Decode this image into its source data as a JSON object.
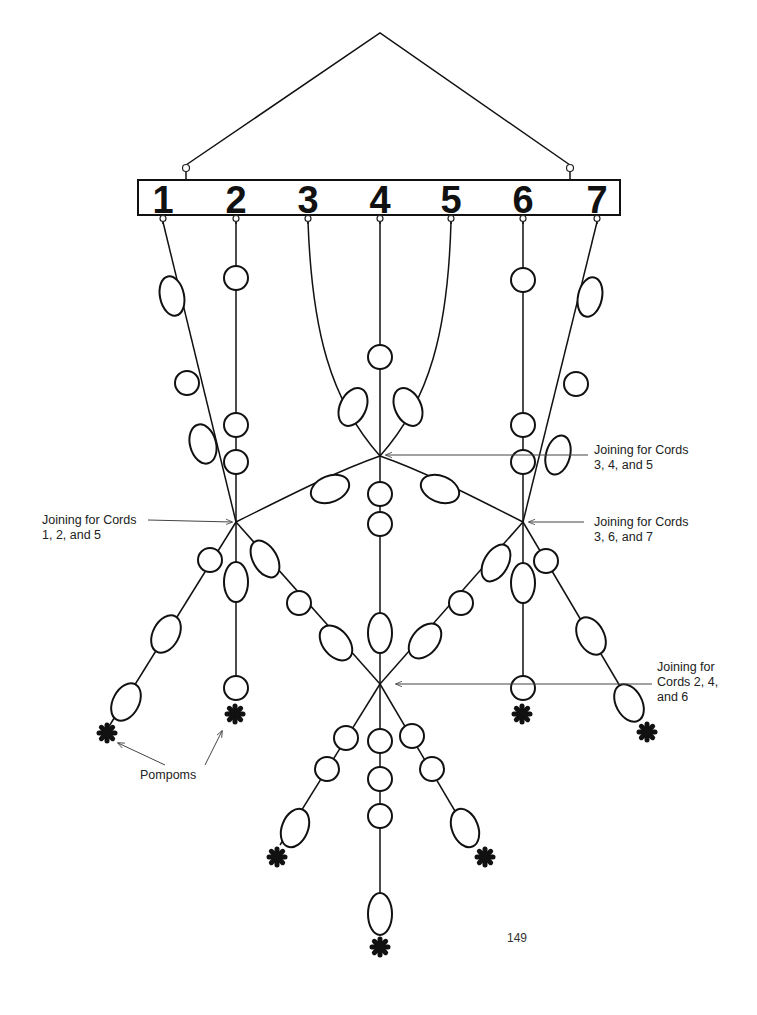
{
  "page": {
    "page_number": "149",
    "background": "#ffffff",
    "ink": "#111111"
  },
  "hanger": {
    "apex": [
      380,
      33
    ],
    "left_ring": [
      186,
      168
    ],
    "right_ring": [
      570,
      168
    ]
  },
  "bar": {
    "x": 138,
    "y": 180,
    "width": 482,
    "height": 35,
    "cord_numbers": [
      {
        "label": "1",
        "x": 163
      },
      {
        "label": "2",
        "x": 236
      },
      {
        "label": "3",
        "x": 308
      },
      {
        "label": "4",
        "x": 380
      },
      {
        "label": "5",
        "x": 451
      },
      {
        "label": "6",
        "x": 523
      },
      {
        "label": "7",
        "x": 597
      }
    ]
  },
  "joinings": [
    {
      "id": "J1",
      "cords": "1, 2, and 5",
      "x": 236,
      "y": 522
    },
    {
      "id": "J2",
      "cords": "3, 4, and 5",
      "x": 380,
      "y": 456
    },
    {
      "id": "J3",
      "cords": "3, 6, and 7",
      "x": 523,
      "y": 522
    },
    {
      "id": "J4",
      "cords": "2, 4, and 6",
      "x": 380,
      "y": 684
    }
  ],
  "callouts": [
    {
      "lines": [
        "Joining for Cords",
        "1, 2, and 5"
      ],
      "text_x": 42,
      "text_y": 524,
      "line_from": [
        148,
        520
      ],
      "arrow_to": [
        232,
        522
      ]
    },
    {
      "lines": [
        "Joining for Cords",
        "3, 4, and 5"
      ],
      "text_x": 594,
      "text_y": 454,
      "line_from": [
        588,
        455
      ],
      "arrow_to": [
        386,
        455
      ]
    },
    {
      "lines": [
        "Joining for Cords",
        "3, 6, and 7"
      ],
      "text_x": 594,
      "text_y": 526,
      "line_from": [
        584,
        522
      ],
      "arrow_to": [
        529,
        522
      ]
    },
    {
      "lines": [
        "Joining for",
        "Cords 2, 4,",
        "and 6"
      ],
      "text_x": 657,
      "text_y": 671,
      "line_from": [
        652,
        684
      ],
      "arrow_to": [
        396,
        684
      ]
    },
    {
      "lines": [
        "Pompoms"
      ],
      "text_x": 140,
      "text_y": 779,
      "line_from": [
        165,
        765
      ],
      "arrow_to": [
        118,
        743
      ],
      "line_from2": [
        205,
        765
      ],
      "arrow_to2": [
        222,
        731
      ]
    }
  ],
  "cords": [
    {
      "name": "cord-1",
      "path": "M163,222 L236,522"
    },
    {
      "name": "cord-2",
      "path": "M236,222 L236,522"
    },
    {
      "name": "cord-3",
      "path": "M308,222 C312,330 330,400 380,456"
    },
    {
      "name": "cord-4",
      "path": "M380,222 L380,684"
    },
    {
      "name": "cord-5",
      "path": "M451,222 C448,330 430,400 380,456"
    },
    {
      "name": "cord-6",
      "path": "M523,222 L523,522"
    },
    {
      "name": "cord-7",
      "path": "M597,222 L523,522"
    },
    {
      "name": "j2-to-j1",
      "path": "M380,456 C340,470 300,490 236,522"
    },
    {
      "name": "j2-to-j3",
      "path": "M380,456 C420,470 460,490 523,522"
    },
    {
      "name": "j1-down-left",
      "path": "M236,522 L108,728"
    },
    {
      "name": "j1-down-center",
      "path": "M236,522 L236,690"
    },
    {
      "name": "j1-to-j4",
      "path": "M236,522 L380,684"
    },
    {
      "name": "j3-to-j4",
      "path": "M523,522 L380,684"
    },
    {
      "name": "j3-down-center",
      "path": "M523,522 L523,690"
    },
    {
      "name": "j3-down-right",
      "path": "M523,522 L640,720"
    },
    {
      "name": "j4-down-left",
      "path": "M380,684 L280,845"
    },
    {
      "name": "j4-down-center",
      "path": "M380,684 L380,935"
    },
    {
      "name": "j4-down-right",
      "path": "M380,684 L475,845"
    }
  ],
  "beads": [
    {
      "cx": 172,
      "cy": 296,
      "rx": 12,
      "ry": 20,
      "rot": -12
    },
    {
      "cx": 187,
      "cy": 383,
      "rx": 12,
      "ry": 12,
      "rot": 0
    },
    {
      "cx": 203,
      "cy": 444,
      "rx": 13,
      "ry": 20,
      "rot": -15
    },
    {
      "cx": 236,
      "cy": 278,
      "rx": 12,
      "ry": 12,
      "rot": 0
    },
    {
      "cx": 236,
      "cy": 425,
      "rx": 12,
      "ry": 12,
      "rot": 0
    },
    {
      "cx": 236,
      "cy": 462,
      "rx": 12,
      "ry": 12,
      "rot": 0
    },
    {
      "cx": 353,
      "cy": 407,
      "rx": 13,
      "ry": 20,
      "rot": 25
    },
    {
      "cx": 408,
      "cy": 407,
      "rx": 13,
      "ry": 20,
      "rot": -25
    },
    {
      "cx": 380,
      "cy": 357,
      "rx": 12,
      "ry": 12,
      "rot": 0
    },
    {
      "cx": 380,
      "cy": 494,
      "rx": 12,
      "ry": 12,
      "rot": 0
    },
    {
      "cx": 380,
      "cy": 524,
      "rx": 12,
      "ry": 12,
      "rot": 0
    },
    {
      "cx": 330,
      "cy": 489,
      "rx": 20,
      "ry": 13,
      "rot": -22
    },
    {
      "cx": 440,
      "cy": 489,
      "rx": 20,
      "ry": 13,
      "rot": 22
    },
    {
      "cx": 523,
      "cy": 280,
      "rx": 12,
      "ry": 12,
      "rot": 0
    },
    {
      "cx": 523,
      "cy": 425,
      "rx": 12,
      "ry": 12,
      "rot": 0
    },
    {
      "cx": 523,
      "cy": 462,
      "rx": 12,
      "ry": 12,
      "rot": 0
    },
    {
      "cx": 590,
      "cy": 297,
      "rx": 12,
      "ry": 20,
      "rot": 12
    },
    {
      "cx": 576,
      "cy": 384,
      "rx": 12,
      "ry": 12,
      "rot": 0
    },
    {
      "cx": 558,
      "cy": 455,
      "rx": 12,
      "ry": 20,
      "rot": 15
    },
    {
      "cx": 210,
      "cy": 560,
      "rx": 12,
      "ry": 12,
      "rot": 0
    },
    {
      "cx": 166,
      "cy": 634,
      "rx": 13,
      "ry": 20,
      "rot": 28
    },
    {
      "cx": 126,
      "cy": 702,
      "rx": 13,
      "ry": 20,
      "rot": 28
    },
    {
      "cx": 236,
      "cy": 582,
      "rx": 12,
      "ry": 20,
      "rot": 0
    },
    {
      "cx": 236,
      "cy": 688,
      "rx": 12,
      "ry": 12,
      "rot": 0
    },
    {
      "cx": 265,
      "cy": 559,
      "rx": 12,
      "ry": 20,
      "rot": -30
    },
    {
      "cx": 299,
      "cy": 603,
      "rx": 12,
      "ry": 12,
      "rot": 0
    },
    {
      "cx": 336,
      "cy": 643,
      "rx": 13,
      "ry": 20,
      "rot": -40
    },
    {
      "cx": 380,
      "cy": 633,
      "rx": 12,
      "ry": 20,
      "rot": 0
    },
    {
      "cx": 425,
      "cy": 641,
      "rx": 13,
      "ry": 20,
      "rot": 40
    },
    {
      "cx": 461,
      "cy": 603,
      "rx": 12,
      "ry": 12,
      "rot": 0
    },
    {
      "cx": 496,
      "cy": 563,
      "rx": 12,
      "ry": 20,
      "rot": 30
    },
    {
      "cx": 523,
      "cy": 583,
      "rx": 12,
      "ry": 20,
      "rot": 0
    },
    {
      "cx": 523,
      "cy": 688,
      "rx": 12,
      "ry": 12,
      "rot": 0
    },
    {
      "cx": 546,
      "cy": 561,
      "rx": 12,
      "ry": 12,
      "rot": 0
    },
    {
      "cx": 591,
      "cy": 636,
      "rx": 13,
      "ry": 20,
      "rot": -28
    },
    {
      "cx": 629,
      "cy": 703,
      "rx": 13,
      "ry": 20,
      "rot": -28
    },
    {
      "cx": 346,
      "cy": 738,
      "rx": 12,
      "ry": 12,
      "rot": 0
    },
    {
      "cx": 327,
      "cy": 769,
      "rx": 12,
      "ry": 12,
      "rot": 0
    },
    {
      "cx": 295,
      "cy": 828,
      "rx": 13,
      "ry": 20,
      "rot": 22
    },
    {
      "cx": 380,
      "cy": 741,
      "rx": 12,
      "ry": 12,
      "rot": 0
    },
    {
      "cx": 380,
      "cy": 779,
      "rx": 12,
      "ry": 12,
      "rot": 0
    },
    {
      "cx": 380,
      "cy": 816,
      "rx": 12,
      "ry": 12,
      "rot": 0
    },
    {
      "cx": 380,
      "cy": 914,
      "rx": 12,
      "ry": 21,
      "rot": 0
    },
    {
      "cx": 412,
      "cy": 736,
      "rx": 12,
      "ry": 12,
      "rot": 0
    },
    {
      "cx": 432,
      "cy": 769,
      "rx": 12,
      "ry": 12,
      "rot": 0
    },
    {
      "cx": 465,
      "cy": 828,
      "rx": 13,
      "ry": 20,
      "rot": -22
    }
  ],
  "pompoms": [
    {
      "x": 107,
      "y": 733
    },
    {
      "x": 235,
      "y": 714
    },
    {
      "x": 522,
      "y": 714
    },
    {
      "x": 647,
      "y": 732
    },
    {
      "x": 277,
      "y": 857
    },
    {
      "x": 485,
      "y": 857
    },
    {
      "x": 380,
      "y": 947
    }
  ]
}
